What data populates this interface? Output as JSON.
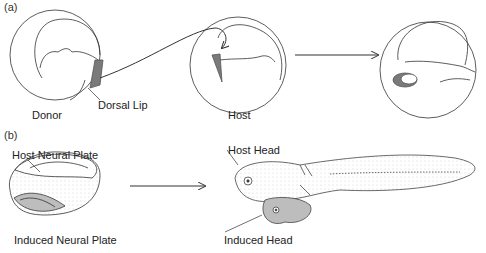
{
  "figure": {
    "panel_a": {
      "label": "(a)",
      "stages": [
        {
          "name": "donor-embryo",
          "caption": "Donor"
        },
        {
          "name": "host-embryo",
          "caption": "Host"
        },
        {
          "name": "result-embryo",
          "caption": ""
        }
      ],
      "annotations": {
        "dorsal_lip": "Dorsal Lip"
      }
    },
    "panel_b": {
      "label": "(b)",
      "annotations": {
        "host_neural_plate": "Host Neural Plate",
        "induced_neural_plate": "Induced Neural Plate",
        "host_head": "Host Head",
        "induced_head": "Induced Head"
      }
    },
    "colors": {
      "line": "#333333",
      "tissue": "#7a7a7a",
      "fill_light": "#bdbdbd",
      "background": "#ffffff"
    }
  }
}
